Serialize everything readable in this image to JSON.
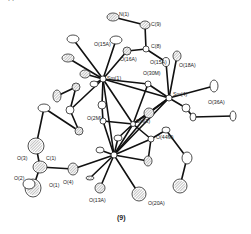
{
  "figure": {
    "caption": "(9)"
  },
  "atoms": [
    {
      "id": "Sm1",
      "label": "Sm(1)",
      "x": 103,
      "y": 79,
      "rx": 3,
      "ry": 3,
      "hatched": false,
      "lx": 107,
      "ly": 80
    },
    {
      "id": "Sm2",
      "label": "Sm(2)",
      "x": 114,
      "y": 155,
      "rx": 3,
      "ry": 3,
      "hatched": false,
      "lx": 0,
      "ly": 0
    },
    {
      "id": "Sm3",
      "label": "Sm(3)",
      "x": 133,
      "y": 124,
      "rx": 2.5,
      "ry": 2.5,
      "hatched": false,
      "lx": 136,
      "ly": 123
    },
    {
      "id": "Sm4",
      "label": "Sm(4)",
      "x": 169,
      "y": 98,
      "rx": 3,
      "ry": 3,
      "hatched": false,
      "lx": 173,
      "ly": 96
    },
    {
      "id": "N1",
      "label": "N(1)",
      "x": 113,
      "y": 17,
      "rx": 6,
      "ry": 4,
      "hatched": true,
      "lx": 119,
      "ly": 16
    },
    {
      "id": "C9",
      "label": "C(9)",
      "x": 145,
      "y": 25,
      "rx": 5,
      "ry": 4,
      "hatched": true,
      "lx": 151,
      "ly": 26
    },
    {
      "id": "C8",
      "label": "C(8)",
      "x": 146,
      "y": 49,
      "rx": 3,
      "ry": 3,
      "hatched": false,
      "lx": 151,
      "ly": 48
    },
    {
      "id": "O15A_top",
      "label": "O(15A)",
      "x": 116,
      "y": 40,
      "rx": 6,
      "ry": 4,
      "hatched": false,
      "lx": 94,
      "ly": 46
    },
    {
      "id": "O16A",
      "label": "O(16A)",
      "x": 127,
      "y": 51,
      "rx": 4,
      "ry": 4,
      "hatched": true,
      "lx": 120,
      "ly": 61
    },
    {
      "id": "O15A_r",
      "label": "O(15A)",
      "x": 166,
      "y": 62,
      "rx": 3.5,
      "ry": 4.5,
      "hatched": false,
      "lx": 150,
      "ly": 64
    },
    {
      "id": "O18A",
      "label": "O(18A)",
      "x": 177,
      "y": 56,
      "rx": 4,
      "ry": 5,
      "hatched": true,
      "lx": 179,
      "ly": 67
    },
    {
      "id": "O36A",
      "label": "O(36A)",
      "x": 214,
      "y": 86,
      "rx": 4,
      "ry": 6,
      "hatched": false,
      "lx": 208,
      "ly": 104
    },
    {
      "id": "O30M",
      "label": "O(30M)",
      "x": 148,
      "y": 84,
      "rx": 3,
      "ry": 3,
      "hatched": false,
      "lx": 143,
      "ly": 75
    },
    {
      "id": "O2M",
      "label": "O(2M)",
      "x": 103,
      "y": 121,
      "rx": 3,
      "ry": 3,
      "hatched": false,
      "lx": 87,
      "ly": 120
    },
    {
      "id": "O44M",
      "label": "O(44M)",
      "x": 151,
      "y": 139,
      "rx": 3,
      "ry": 3,
      "hatched": false,
      "lx": 156,
      "ly": 139
    },
    {
      "id": "O4",
      "label": "O(4)",
      "x": 73,
      "y": 169,
      "rx": 5,
      "ry": 6,
      "hatched": true,
      "lx": 63,
      "ly": 184
    },
    {
      "id": "O13A",
      "label": "O(13A)",
      "x": 100,
      "y": 188,
      "rx": 5,
      "ry": 5,
      "hatched": true,
      "lx": 89,
      "ly": 202
    },
    {
      "id": "O20A",
      "label": "O(20A)",
      "x": 139,
      "y": 194,
      "rx": 7,
      "ry": 7,
      "hatched": true,
      "lx": 148,
      "ly": 205
    },
    {
      "id": "C3",
      "label": "O(3)",
      "x": 36,
      "y": 146,
      "rx": 8,
      "ry": 8,
      "hatched": true,
      "lx": 17,
      "ly": 160
    },
    {
      "id": "C1",
      "label": "C(1)",
      "x": 40,
      "y": 167,
      "rx": 7,
      "ry": 6,
      "hatched": true,
      "lx": 46,
      "ly": 160
    },
    {
      "id": "O1",
      "label": "O(1)",
      "x": 33,
      "y": 188,
      "rx": 8,
      "ry": 9,
      "hatched": true,
      "lx": 49,
      "ly": 187
    },
    {
      "id": "O2",
      "label": "O(2)",
      "x": 29,
      "y": 184,
      "rx": 6,
      "ry": 5,
      "hatched": false,
      "lx": 14,
      "ly": 180
    },
    {
      "id": "E1",
      "label": "",
      "x": 73,
      "y": 39,
      "rx": 6,
      "ry": 4,
      "hatched": false,
      "lx": 0,
      "ly": 0
    },
    {
      "id": "E2",
      "label": "",
      "x": 68,
      "y": 58,
      "rx": 6,
      "ry": 4,
      "hatched": true,
      "lx": 0,
      "ly": 0
    },
    {
      "id": "E3",
      "label": "",
      "x": 85,
      "y": 74,
      "rx": 5,
      "ry": 4,
      "hatched": true,
      "lx": 0,
      "ly": 0
    },
    {
      "id": "E4",
      "label": "",
      "x": 94,
      "y": 84,
      "rx": 4,
      "ry": 3,
      "hatched": false,
      "lx": 0,
      "ly": 0
    },
    {
      "id": "E5",
      "label": "",
      "x": 76,
      "y": 87,
      "rx": 4,
      "ry": 4,
      "hatched": true,
      "lx": 0,
      "ly": 0
    },
    {
      "id": "E6",
      "label": "",
      "x": 57,
      "y": 96,
      "rx": 4,
      "ry": 6,
      "hatched": true,
      "lx": 0,
      "ly": 0
    },
    {
      "id": "E7",
      "label": "",
      "x": 44,
      "y": 108,
      "rx": 6,
      "ry": 4,
      "hatched": false,
      "lx": 0,
      "ly": 0
    },
    {
      "id": "E8",
      "label": "",
      "x": 70,
      "y": 110,
      "rx": 4,
      "ry": 4,
      "hatched": false,
      "lx": 0,
      "ly": 0
    },
    {
      "id": "E9",
      "label": "",
      "x": 79,
      "y": 131,
      "rx": 4,
      "ry": 4,
      "hatched": true,
      "lx": 0,
      "ly": 0
    },
    {
      "id": "E10",
      "label": "",
      "x": 102,
      "y": 105,
      "rx": 4,
      "ry": 4,
      "hatched": false,
      "lx": 0,
      "ly": 0
    },
    {
      "id": "E11",
      "label": "",
      "x": 149,
      "y": 113,
      "rx": 5,
      "ry": 5,
      "hatched": true,
      "lx": 0,
      "ly": 0
    },
    {
      "id": "E12",
      "label": "",
      "x": 193,
      "y": 117,
      "rx": 3,
      "ry": 4,
      "hatched": false,
      "lx": 0,
      "ly": 0
    },
    {
      "id": "E13",
      "label": "",
      "x": 233,
      "y": 116,
      "rx": 3,
      "ry": 5,
      "hatched": false,
      "lx": 0,
      "ly": 0
    },
    {
      "id": "E14",
      "label": "",
      "x": 186,
      "y": 108,
      "rx": 4,
      "ry": 4,
      "hatched": false,
      "lx": 0,
      "ly": 0
    },
    {
      "id": "E15",
      "label": "",
      "x": 166,
      "y": 130,
      "rx": 4,
      "ry": 3,
      "hatched": false,
      "lx": 0,
      "ly": 0
    },
    {
      "id": "E16",
      "label": "",
      "x": 187,
      "y": 158,
      "rx": 5,
      "ry": 6,
      "hatched": false,
      "lx": 0,
      "ly": 0
    },
    {
      "id": "E17",
      "label": "",
      "x": 180,
      "y": 186,
      "rx": 7,
      "ry": 7,
      "hatched": true,
      "lx": 0,
      "ly": 0
    },
    {
      "id": "E18",
      "label": "",
      "x": 148,
      "y": 161,
      "rx": 4,
      "ry": 5,
      "hatched": true,
      "lx": 0,
      "ly": 0
    },
    {
      "id": "E19",
      "label": "",
      "x": 118,
      "y": 138,
      "rx": 4,
      "ry": 3,
      "hatched": false,
      "lx": 0,
      "ly": 0
    },
    {
      "id": "E20",
      "label": "",
      "x": 90,
      "y": 178,
      "rx": 4,
      "ry": 2,
      "hatched": true,
      "lx": 0,
      "ly": 0
    },
    {
      "id": "E21",
      "label": "",
      "x": 100,
      "y": 150,
      "rx": 4,
      "ry": 3,
      "hatched": false,
      "lx": 0,
      "ly": 0
    }
  ],
  "bonds": [
    [
      "N1",
      "C9"
    ],
    [
      "C9",
      "C8"
    ],
    [
      "C8",
      "O16A"
    ],
    [
      "C8",
      "O15A_r"
    ],
    [
      "Sm1",
      "O15A_top"
    ],
    [
      "Sm1",
      "O16A"
    ],
    [
      "Sm1",
      "E1"
    ],
    [
      "Sm1",
      "E2"
    ],
    [
      "Sm1",
      "E3"
    ],
    [
      "Sm1",
      "E4"
    ],
    [
      "Sm1",
      "O30M"
    ],
    [
      "Sm1",
      "Sm4"
    ],
    [
      "Sm1",
      "E10"
    ],
    [
      "Sm1",
      "E8"
    ],
    [
      "Sm1",
      "Sm2"
    ],
    [
      "Sm1",
      "Sm3"
    ],
    [
      "E5",
      "E6"
    ],
    [
      "E5",
      "E8"
    ],
    [
      "E8",
      "E9"
    ],
    [
      "E7",
      "E9"
    ],
    [
      "E7",
      "C3"
    ],
    [
      "Sm4",
      "O15A_r"
    ],
    [
      "Sm4",
      "O18A"
    ],
    [
      "Sm4",
      "O36A"
    ],
    [
      "Sm4",
      "O30M"
    ],
    [
      "Sm4",
      "E14"
    ],
    [
      "Sm4",
      "Sm3"
    ],
    [
      "Sm4",
      "E11"
    ],
    [
      "Sm4",
      "Sm2"
    ],
    [
      "E14",
      "E12"
    ],
    [
      "E12",
      "E13"
    ],
    [
      "Sm3",
      "O2M"
    ],
    [
      "Sm3",
      "O44M"
    ],
    [
      "Sm3",
      "E11"
    ],
    [
      "Sm3",
      "Sm2"
    ],
    [
      "Sm3",
      "E19"
    ],
    [
      "O44M",
      "E15"
    ],
    [
      "E15",
      "E16"
    ],
    [
      "E16",
      "E17"
    ],
    [
      "O44M",
      "E18"
    ],
    [
      "Sm2",
      "O2M"
    ],
    [
      "Sm2",
      "O4"
    ],
    [
      "Sm2",
      "O13A"
    ],
    [
      "Sm2",
      "O20A"
    ],
    [
      "Sm2",
      "E20"
    ],
    [
      "Sm2",
      "E18"
    ],
    [
      "Sm2",
      "E21"
    ],
    [
      "Sm2",
      "E11"
    ],
    [
      "Sm2",
      "O44M"
    ],
    [
      "Sm2",
      "E19"
    ],
    [
      "O4",
      "C1"
    ],
    [
      "C1",
      "C3"
    ],
    [
      "C1",
      "O1"
    ],
    [
      "E10",
      "O2M"
    ],
    [
      "O30M",
      "Sm3"
    ]
  ]
}
